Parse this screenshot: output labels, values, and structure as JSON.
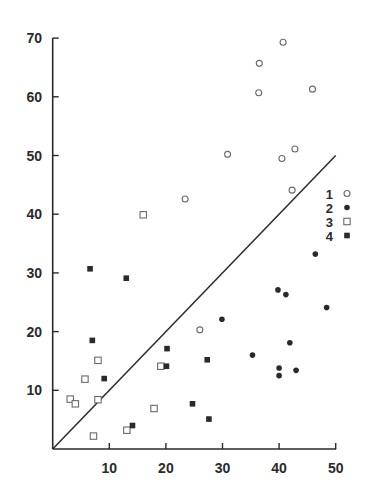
{
  "chart_data": {
    "type": "scatter",
    "title": "",
    "xlabel": "",
    "ylabel": "",
    "xlim": [
      0,
      50
    ],
    "ylim": [
      0,
      70
    ],
    "xticks": [
      10,
      20,
      30,
      40,
      50
    ],
    "yticks": [
      10,
      20,
      30,
      40,
      50,
      60,
      70
    ],
    "grid": false,
    "legend_position": "right, inside",
    "reference_line": {
      "type": "y=x",
      "from": [
        0,
        0
      ],
      "to": [
        50,
        50
      ]
    },
    "series": [
      {
        "name": "1",
        "marker": "open-circle",
        "points": [
          [
            40.7,
            69.3
          ],
          [
            36.5,
            65.7
          ],
          [
            36.4,
            60.7
          ],
          [
            45.9,
            61.3
          ],
          [
            30.9,
            50.2
          ],
          [
            40.5,
            49.5
          ],
          [
            42.8,
            51.1
          ],
          [
            42.3,
            44.1
          ],
          [
            23.4,
            42.6
          ],
          [
            26.0,
            20.3
          ]
        ]
      },
      {
        "name": "2",
        "marker": "filled-circle",
        "points": [
          [
            46.4,
            33.2
          ],
          [
            39.8,
            27.1
          ],
          [
            41.2,
            26.3
          ],
          [
            48.4,
            24.1
          ],
          [
            29.9,
            22.1
          ],
          [
            41.9,
            18.1
          ],
          [
            35.3,
            16.0
          ],
          [
            40.0,
            13.8
          ],
          [
            43.0,
            13.4
          ],
          [
            40.0,
            12.5
          ]
        ]
      },
      {
        "name": "3",
        "marker": "open-square",
        "points": [
          [
            16.0,
            39.9
          ],
          [
            8.0,
            15.1
          ],
          [
            5.7,
            11.9
          ],
          [
            19.1,
            14.1
          ],
          [
            3.1,
            8.5
          ],
          [
            4.0,
            7.7
          ],
          [
            8.0,
            8.4
          ],
          [
            17.9,
            6.9
          ],
          [
            7.2,
            2.2
          ],
          [
            13.1,
            3.2
          ]
        ]
      },
      {
        "name": "4",
        "marker": "filled-square",
        "points": [
          [
            6.6,
            30.7
          ],
          [
            13.0,
            29.1
          ],
          [
            7.0,
            18.5
          ],
          [
            20.2,
            17.1
          ],
          [
            27.3,
            15.2
          ],
          [
            20.1,
            14.1
          ],
          [
            9.1,
            12.0
          ],
          [
            24.7,
            7.7
          ],
          [
            27.6,
            5.1
          ],
          [
            14.1,
            4.0
          ]
        ]
      }
    ]
  },
  "legend": {
    "items": [
      {
        "label": "1",
        "marker": "open-circle"
      },
      {
        "label": "2",
        "marker": "filled-circle"
      },
      {
        "label": "3",
        "marker": "open-square"
      },
      {
        "label": "4",
        "marker": "filled-square"
      }
    ]
  },
  "colors": {
    "ink": "#2a2a2a",
    "open_marker": "#6a6a6a",
    "background": "#ffffff"
  }
}
